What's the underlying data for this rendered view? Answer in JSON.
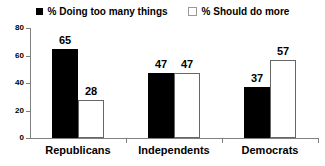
{
  "chart_data": {
    "type": "bar",
    "categories": [
      "Republicans",
      "Independents",
      "Democrats"
    ],
    "series": [
      {
        "name": "% Doing too many things",
        "swatch": "filled",
        "color": "#000000",
        "values": [
          65,
          47,
          37
        ]
      },
      {
        "name": "% Should do more",
        "swatch": "open",
        "color": "#ffffff",
        "values": [
          28,
          47,
          57
        ]
      }
    ],
    "ylim": [
      0,
      80
    ],
    "yticks": [
      0,
      20,
      40,
      60,
      80
    ],
    "grid": false,
    "legend_position": "top",
    "value_labels": true
  },
  "colors": {
    "bar_filled": "#000000",
    "bar_open_border": "#666666",
    "axis": "#808080",
    "text": "#000000",
    "background": "#ffffff"
  }
}
